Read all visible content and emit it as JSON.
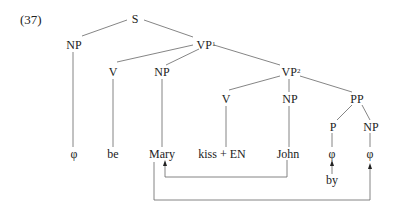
{
  "example_number": "(37)",
  "nodes": {
    "S": {
      "label": "S",
      "x": 135,
      "y": 19
    },
    "NP_subj": {
      "label": "NP",
      "x": 74,
      "y": 45
    },
    "VP1": {
      "label": "VP",
      "sup": "1",
      "x": 206,
      "y": 45
    },
    "V_be": {
      "label": "V",
      "x": 113,
      "y": 72
    },
    "NP_obj": {
      "label": "NP",
      "x": 162,
      "y": 72
    },
    "VP2": {
      "label": "VP",
      "sup": "2",
      "x": 291,
      "y": 72
    },
    "V_kiss": {
      "label": "V",
      "x": 226,
      "y": 99
    },
    "NP_john": {
      "label": "NP",
      "x": 290,
      "y": 99
    },
    "PP": {
      "label": "PP",
      "x": 357,
      "y": 99
    },
    "P": {
      "label": "P",
      "x": 333,
      "y": 127
    },
    "NP_pp": {
      "label": "NP",
      "x": 371,
      "y": 127
    }
  },
  "leaves": [
    {
      "id": "leaf_phi1",
      "label": "φ",
      "x": 74,
      "y": 154
    },
    {
      "id": "leaf_be",
      "label": "be",
      "x": 113,
      "y": 154
    },
    {
      "id": "leaf_mary",
      "label": "Mary",
      "x": 162,
      "y": 154
    },
    {
      "id": "leaf_kiss",
      "label": "kiss + EN",
      "x": 222,
      "y": 154
    },
    {
      "id": "leaf_john",
      "label": "John",
      "x": 288,
      "y": 154
    },
    {
      "id": "leaf_phi2",
      "label": "φ",
      "x": 332,
      "y": 154
    },
    {
      "id": "leaf_phi3",
      "label": "φ",
      "x": 370,
      "y": 154
    }
  ],
  "extra": {
    "by": {
      "label": "by",
      "x": 332,
      "y": 180
    }
  },
  "edges": [
    [
      "S",
      "NP_subj"
    ],
    [
      "S",
      "VP1"
    ],
    [
      "VP1",
      "V_be"
    ],
    [
      "VP1",
      "NP_obj"
    ],
    [
      "VP1",
      "VP2"
    ],
    [
      "VP2",
      "V_kiss"
    ],
    [
      "VP2",
      "NP_john"
    ],
    [
      "VP2",
      "PP"
    ],
    [
      "PP",
      "P"
    ],
    [
      "PP",
      "NP_pp"
    ]
  ],
  "movements": [
    {
      "name": "john-to-mary",
      "from": "John",
      "to": "Mary"
    },
    {
      "name": "mary-to-phi",
      "from": "Mary",
      "to": "φ (NP in PP)"
    },
    {
      "name": "by-insertion",
      "from": "by",
      "to": "φ (P)"
    }
  ]
}
